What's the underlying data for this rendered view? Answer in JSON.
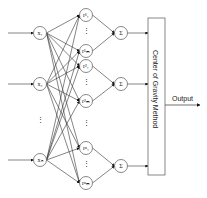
{
  "inputs": [
    {
      "label": "x₁",
      "y": 33
    },
    {
      "label": "x₂",
      "y": 84
    },
    {
      "label": "xₙ",
      "y": 160
    }
  ],
  "rules": [
    {
      "label": "r¹₁",
      "y": 15
    },
    {
      "label": "r¹ₘ",
      "y": 51
    },
    {
      "label": "r²₁",
      "y": 66
    },
    {
      "label": "r²ₘ",
      "y": 101
    },
    {
      "label": "rⁿ₁",
      "y": 148
    },
    {
      "label": "rⁿₘ",
      "y": 183
    }
  ],
  "sums": [
    {
      "label": "Σ",
      "y": 33
    },
    {
      "label": "Σ",
      "y": 84
    },
    {
      "label": "Σ",
      "y": 166
    }
  ],
  "ellipsis": "⋮",
  "box_label": "Center of Gravity Method",
  "output_label": "Output"
}
